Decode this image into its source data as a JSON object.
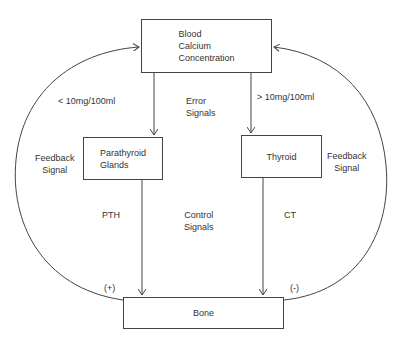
{
  "nodes": {
    "blood_calcium": "Blood\nCalcium\nConcentration",
    "parathyroid": "Parathyroid\nGlands",
    "thyroid": "Thyroid",
    "bone": "Bone"
  },
  "labels": {
    "low_threshold": "< 10mg/100ml",
    "high_threshold": "> 10mg/100ml",
    "error_signals": "Error\nSignals",
    "feedback_left": "Feedback\nSignal",
    "feedback_right": "Feedback\nSignal",
    "pth": "PTH",
    "ct": "CT",
    "control_signals": "Control\nSignals",
    "plus": "(+)",
    "minus": "(-)"
  },
  "colors": {
    "line": "#444444",
    "text": "#333333"
  }
}
